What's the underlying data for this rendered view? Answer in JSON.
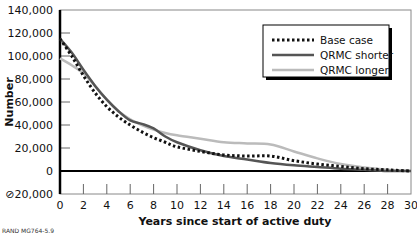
{
  "chart_data": {
    "type": "line",
    "title": "",
    "xlabel": "Years since start of active duty",
    "ylabel": "Number",
    "xlim": [
      0,
      30
    ],
    "ylim": [
      -20000,
      140000
    ],
    "x_ticks": [
      0,
      2,
      4,
      6,
      8,
      10,
      12,
      14,
      16,
      18,
      20,
      22,
      24,
      26,
      28,
      30
    ],
    "y_ticks": [
      -20000,
      0,
      20000,
      40000,
      60000,
      80000,
      100000,
      120000,
      140000
    ],
    "y_tick_labels": [
      "⊘20,000",
      "0",
      "20,000",
      "40,000",
      "60,000",
      "80,000",
      "100,000",
      "120,000",
      "140,000"
    ],
    "grid": false,
    "legend_position": "upper right",
    "series": [
      {
        "name": "Base case",
        "style": "dotted",
        "color": "#111111",
        "x": [
          0,
          1,
          2,
          3,
          4,
          5,
          6,
          7,
          8,
          9,
          10,
          12,
          14,
          16,
          18,
          20,
          22,
          24,
          26,
          28,
          30
        ],
        "values": [
          115000,
          100000,
          83000,
          68000,
          56000,
          47000,
          40000,
          34000,
          29000,
          25000,
          21000,
          17000,
          14000,
          13000,
          13000,
          9000,
          6000,
          4000,
          2000,
          1000,
          0
        ]
      },
      {
        "name": "QRMC shorter",
        "style": "solid",
        "color": "#555555",
        "x": [
          0,
          1,
          2,
          3,
          4,
          5,
          6,
          7,
          8,
          9,
          10,
          12,
          14,
          16,
          18,
          20,
          22,
          24,
          26,
          28,
          30
        ],
        "values": [
          115000,
          103000,
          88000,
          74000,
          62000,
          52000,
          44000,
          41000,
          37000,
          30000,
          25000,
          18000,
          13000,
          10000,
          7000,
          5000,
          3500,
          2000,
          1000,
          0,
          0
        ]
      },
      {
        "name": "QRMC longer",
        "style": "solid",
        "color": "#bbbbbb",
        "x": [
          0,
          1,
          2,
          3,
          4,
          5,
          6,
          7,
          8,
          9,
          10,
          12,
          14,
          16,
          18,
          20,
          22,
          24,
          26,
          28,
          30
        ],
        "values": [
          98000,
          92000,
          85000,
          74000,
          62000,
          52000,
          45000,
          40000,
          36000,
          33000,
          31000,
          28000,
          25000,
          24000,
          23000,
          17000,
          11000,
          6000,
          3000,
          1000,
          0
        ]
      }
    ]
  },
  "source_note": "RAND MG764-5.9"
}
